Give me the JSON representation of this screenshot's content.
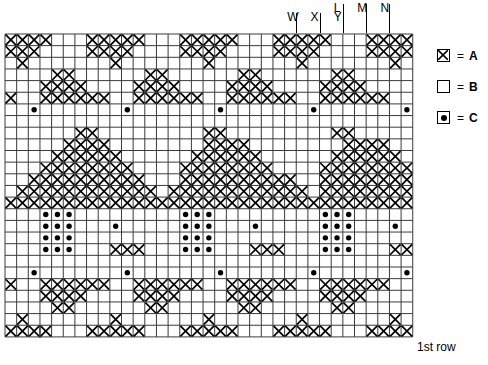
{
  "chart_data": {
    "type": "heatmap",
    "title": "",
    "xlabel": "",
    "ylabel": "",
    "grid": true,
    "legend_position": "right",
    "cols": 35,
    "rows": 26,
    "cell_px": 11.65,
    "symbols": {
      "A": "cross-filled-square",
      "B": "empty-square",
      "C": "dotted-square"
    },
    "row_order": "top row is last row; bottom row is 1st row",
    "rows_data": [
      "AAAABBBAAAAABBBAAAAABBBAAAAABBBAAAAA",
      "AAABBBBAAAABBBBAAAABBBBAAAABBBBAAAAB",
      "BABBBBBBBABBBBBBBABBBBBBBABBBBBBBABB",
      "BBBBAABBBBBBAABBBBBBAABBBBBBAABBBBBB",
      "BBBAAAABBBBAAAABBBBAAAABBBBAAAABBBBB",
      "ABBAAAAAABBAAAAAABBAAAAAABBAAAAAABBA",
      "BBCBBBBBBBCBBBBBBBCBBBBBBBCBBBBBBBCB",
      "BBBBBBBBBBBBBBBBBBBBBBBBBBBBBBBBBBBB",
      "BBBBBBAABBBBBBBBBAABBBBBBBBBAABBBBBB",
      "BBBBBAAAABBBBBBBBAAAABBBBBBBBAAAABBB",
      "BBBBAAAAAABBBBBBAAAAAABBBBBBAAAAAABB",
      "BBBAAAAAAAABBBBAAAAAAAABBBBAAAAAAAAB",
      "BBAAAAAAAAAABBBAAAAAAAAAABBAAAAAAAAA",
      "BAAAAAAAAAAAABAAAAAAAAAAAABAAAAAAAAA",
      "AAAAAAAAAAAAAAAAAAAAAAAAAAAAAAAAAAAA",
      "BBBCCCBBBBBBBBBCCCBBBBBBBBBCCCBBBBBB",
      "BBBCCCBBBCBBBBBCCCBBBCBBBBBCCCBBBCBB",
      "BBBCCCBBBBBBBBBCCCBBBBBBBBBCCCBBBBBB",
      "BBBCCCBBBAAABBBCCCBBBAAABBBCCCBBBAAA",
      "BBBBBBBBBBBBBBBBBBBBBBBBBBBBBBBBBBBB",
      "BBCBBBBBBBCBBBBBBBCBBBBBBBCBBBBBBBCB",
      "ABBAAAAAABBAAAAAABBAAAAAABBAAAAAABBA",
      "BBBAAAABBBBAAAABBBBAAAABBBBAAAABBBBB",
      "BBBBAABBBBBBAABBBBBBAABBBBBBAABBBBBB",
      "BABBBBBBBABBBBBBBABBBBBBBABBBBBBBABB",
      "AAAABBBAAAAABBBAAAAABBBAAAAABBBAAAAA"
    ]
  },
  "column_labels": [
    {
      "text": "W",
      "col": 25
    },
    {
      "text": "X",
      "col": 27
    },
    {
      "text": "L",
      "col": 29
    },
    {
      "text": "Y",
      "col": 29
    },
    {
      "text": "M",
      "col": 31
    },
    {
      "text": "N",
      "col": 33
    }
  ],
  "legend": {
    "items": [
      {
        "symbol": "cross-filled-square",
        "equals": "=",
        "name": "A"
      },
      {
        "symbol": "empty-square",
        "equals": "=",
        "name": "B"
      },
      {
        "symbol": "dotted-square",
        "equals": "=",
        "name": "C"
      }
    ]
  },
  "annotations": {
    "first_row": "1st row"
  },
  "colors": {
    "ink": "#000000",
    "background": "#ffffff",
    "gridline": "#3a3a3a"
  }
}
